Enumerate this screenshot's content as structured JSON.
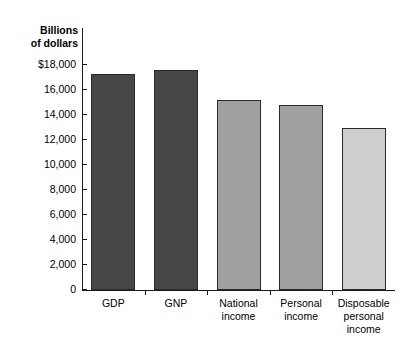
{
  "chart_data": {
    "type": "bar",
    "title": "",
    "ylabel": "Billions\nof dollars",
    "xlabel": "",
    "ylim": [
      0,
      18000
    ],
    "grid": false,
    "legend": "none",
    "ytick_labels": [
      "$18,000",
      "16,000",
      "14,000",
      "12,000",
      "10,000",
      "8,000",
      "6,000",
      "4,000",
      "2,000",
      "0"
    ],
    "ytick_values": [
      18000,
      16000,
      14000,
      12000,
      10000,
      8000,
      6000,
      4000,
      2000,
      0
    ],
    "categories": [
      "GDP",
      "GNP",
      "National\nincome",
      "Personal\nincome",
      "Disposable\npersonal\nincome"
    ],
    "values": [
      17300,
      17600,
      15200,
      14800,
      13000
    ],
    "bar_colors": [
      "#474747",
      "#474747",
      "#a0a0a0",
      "#a0a0a0",
      "#cfcfcf"
    ],
    "bar_outline_color": "#2b2b2b"
  }
}
